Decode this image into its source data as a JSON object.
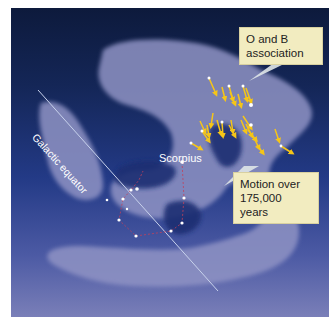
{
  "figure": {
    "title": "",
    "labels": {
      "galactic_equator": "Galactic equator",
      "constellation": "Scorpius"
    },
    "callouts": {
      "ob_association": "O and B association",
      "motion": "Motion over 175,000 years"
    },
    "colors": {
      "sky_top": "#0d1a3c",
      "sky_bottom": "#7a7fb8",
      "cloud": "#8f93c4",
      "arrow": "#f5c518",
      "star": "#ffffff",
      "constellation_line": "#c0405a",
      "callout_bg": "#f2ecc0"
    }
  }
}
